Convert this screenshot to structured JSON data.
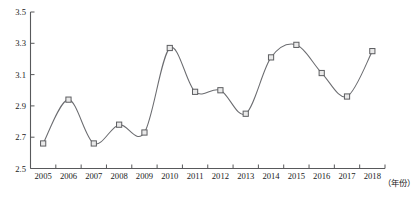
{
  "chart_data": {
    "type": "line",
    "title": "",
    "xlabel": "（年份）",
    "ylabel": "",
    "categories": [
      "2005",
      "2006",
      "2007",
      "2008",
      "2009",
      "2010",
      "2011",
      "2012",
      "2013",
      "2014",
      "2015",
      "2016",
      "2017",
      "2018"
    ],
    "values": [
      2.66,
      2.94,
      2.66,
      2.78,
      2.73,
      3.27,
      2.99,
      3.0,
      2.85,
      3.21,
      3.29,
      3.11,
      2.96,
      3.25
    ],
    "series": [
      {
        "name": "series-1",
        "values": [
          2.66,
          2.94,
          2.66,
          2.78,
          2.73,
          3.27,
          2.99,
          3.0,
          2.85,
          3.21,
          3.29,
          3.11,
          2.96,
          3.25
        ]
      }
    ],
    "ylim": [
      2.5,
      3.5
    ],
    "yticks": [
      "2.5",
      "2.7",
      "2.9",
      "3.1",
      "3.3",
      "3.5"
    ],
    "ytick_values": [
      2.5,
      2.7,
      2.9,
      3.1,
      3.3,
      3.5
    ],
    "xticks": [
      "2005",
      "2006",
      "2007",
      "2008",
      "2009",
      "2010",
      "2011",
      "2012",
      "2013",
      "2014",
      "2015",
      "2016",
      "2017",
      "2018"
    ],
    "grid": false,
    "legend": "none",
    "marker": "square",
    "line_color": "#6b6c70",
    "marker_fill": "#e9e9e9",
    "marker_edge": "#5d5e61",
    "axis_color": "#58595b",
    "smoothing": "spline"
  },
  "axis": {
    "x_caption": "（年份）"
  }
}
